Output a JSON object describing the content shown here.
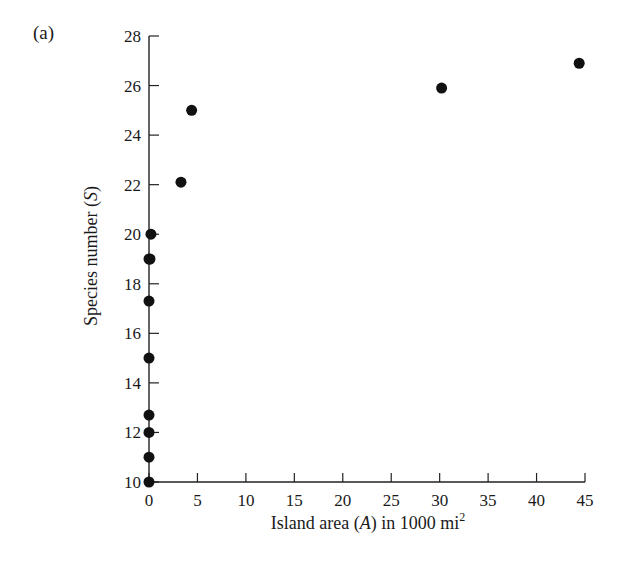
{
  "panel_label": "(a)",
  "chart_data": {
    "type": "scatter",
    "title": "",
    "xlabel": "Island area (A) in 1000 mi²",
    "ylabel": "Species number (S)",
    "xlim": [
      0,
      45
    ],
    "ylim": [
      10,
      28
    ],
    "x_ticks": [
      0,
      5,
      10,
      15,
      20,
      25,
      30,
      35,
      40,
      45
    ],
    "y_ticks": [
      10,
      12,
      14,
      16,
      18,
      20,
      22,
      24,
      26,
      28
    ],
    "grid": false,
    "legend": null,
    "points": [
      {
        "x": 0.0,
        "y": 10
      },
      {
        "x": 0.0,
        "y": 11
      },
      {
        "x": 0.0,
        "y": 12
      },
      {
        "x": 0.0,
        "y": 12.7
      },
      {
        "x": 0.0,
        "y": 15
      },
      {
        "x": 0.0,
        "y": 17.3
      },
      {
        "x": 0.0,
        "y": 19
      },
      {
        "x": 0.1,
        "y": 19
      },
      {
        "x": 0.2,
        "y": 20
      },
      {
        "x": 3.3,
        "y": 22.1
      },
      {
        "x": 4.4,
        "y": 25
      },
      {
        "x": 30.2,
        "y": 25.9
      },
      {
        "x": 44.4,
        "y": 26.9
      }
    ],
    "marker_color": "#111111"
  },
  "axis_title_parts": {
    "x_prefix": "Island area (",
    "x_var": "A",
    "x_suffix": ") in 1000 mi",
    "x_sup": "2",
    "y_prefix": "Species number (",
    "y_var": "S",
    "y_suffix": ")"
  }
}
